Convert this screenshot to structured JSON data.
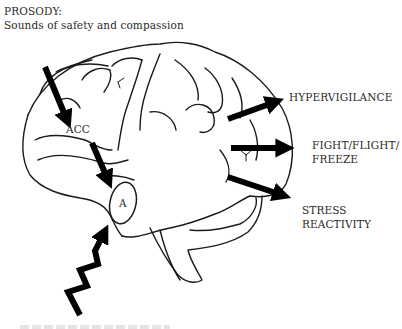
{
  "diagram": {
    "type": "brain-pathway-illustration",
    "colors": {
      "outline": "#1a1a1a",
      "arrow": "#000000",
      "text": "#2a2a2a",
      "background": "#ffffff"
    },
    "labels": {
      "prosody_title": "PROSODY:",
      "prosody_subtitle": "Sounds of safety and compassion",
      "acc": "ACC",
      "amygdala": "A",
      "hypervigilance": "HYPERVIGILANCE",
      "fight_line1": "FIGHT/FLIGHT/",
      "fight_line2": "FREEZE",
      "stress_line1": "STRESS",
      "stress_line2": "REACTIVITY"
    },
    "arrows": [
      {
        "from": "prosody",
        "to": "acc",
        "style": "straight"
      },
      {
        "from": "acc",
        "to": "amygdala",
        "style": "straight"
      },
      {
        "from": "below",
        "to": "amygdala",
        "style": "zigzag-lightning"
      },
      {
        "from": "brain",
        "to": "hypervigilance",
        "style": "straight"
      },
      {
        "from": "brain",
        "to": "fight_flight_freeze",
        "style": "straight"
      },
      {
        "from": "brain",
        "to": "stress_reactivity",
        "style": "straight"
      }
    ]
  }
}
